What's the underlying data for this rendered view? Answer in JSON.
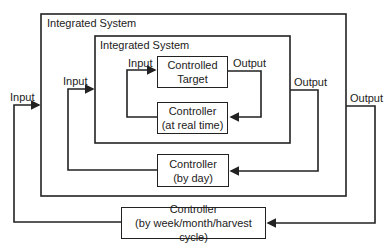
{
  "diagram": {
    "outer_system": {
      "label": "Integrated System"
    },
    "inner_system": {
      "label": "Integrated System"
    },
    "controlled_target": {
      "line1": "Controlled",
      "line2": "Target"
    },
    "controller_realtime": {
      "line1": "Controller",
      "line2": "(at real time)"
    },
    "controller_day": {
      "line1": "Controller",
      "line2": "(by day)"
    },
    "controller_week": {
      "line1": "Controller",
      "line2": "(by week/month/harvest cycle)"
    },
    "labels": {
      "input_outer": "Input",
      "input_mid": "Input",
      "input_inner": "Input",
      "output_inner": "Output",
      "output_mid": "Output",
      "output_outer": "Output"
    },
    "line_color": "#222222"
  }
}
